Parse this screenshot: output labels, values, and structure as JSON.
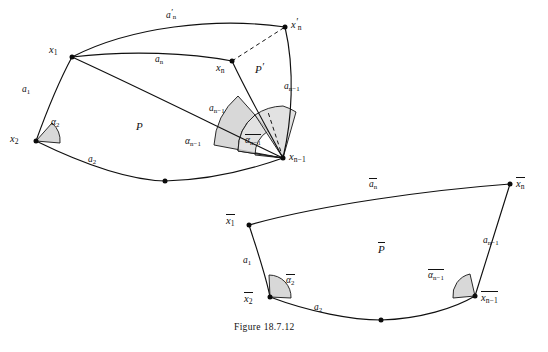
{
  "figure": {
    "caption": "Figure 18.7.12",
    "background_color": "#ffffff",
    "ink_color": "#111111",
    "angle_shade_color": "#cfcfcf"
  },
  "upper_diagram": {
    "name": "geodesic-polygon-P-and-P-prime",
    "region_labels": {
      "P": "P",
      "P_prime": "P′"
    },
    "vertices": [
      {
        "id": "x1",
        "label_html": "x<sub>1</sub>",
        "x": 72,
        "y": 57
      },
      {
        "id": "x2",
        "label_html": "x<sub>2</sub>",
        "x": 36,
        "y": 141
      },
      {
        "id": "xmid",
        "label_html": "",
        "x": 165,
        "y": 181
      },
      {
        "id": "xn_1",
        "label_html": "x<sub>n−1</sub>",
        "x": 283,
        "y": 158
      },
      {
        "id": "xn",
        "label_html": "x<sub>n</sub>",
        "x": 232,
        "y": 61
      },
      {
        "id": "xn_prime",
        "label_html": "x′<sub>n</sub>",
        "x": 285,
        "y": 27
      }
    ],
    "edge_labels": [
      {
        "id": "a1",
        "text": "a<sub>1</sub>",
        "x": 28,
        "y": 90
      },
      {
        "id": "a2",
        "text": "a<sub>2</sub>",
        "x": 94,
        "y": 161
      },
      {
        "id": "an",
        "text": "a<sub>n</sub>",
        "x": 161,
        "y": 61
      },
      {
        "id": "an_prime",
        "text": "a′<sub>n</sub>",
        "x": 173,
        "y": 14
      },
      {
        "id": "an_1_left",
        "text": "a<sub>n−1</sub>",
        "x": 218,
        "y": 110
      },
      {
        "id": "an_1_right",
        "text": "a<sub>n−1</sub>",
        "x": 290,
        "y": 88
      }
    ],
    "angle_labels": [
      {
        "id": "alpha2",
        "text": "α<sub>2</sub>",
        "x": 57,
        "y": 124,
        "overline": false
      },
      {
        "id": "alpha_n_1",
        "text": "α<sub>n−1</sub>",
        "x": 196,
        "y": 143,
        "overline": false
      },
      {
        "id": "alpha_n_1_bar",
        "text": "α<sub>n−1</sub>",
        "x": 253,
        "y": 140,
        "overline": true
      }
    ],
    "dashed_segment": {
      "from": "xn",
      "to": "xn_prime"
    }
  },
  "lower_diagram": {
    "name": "comparison-polygon-P-bar",
    "region_labels": {
      "P_bar": "P"
    },
    "vertices": [
      {
        "id": "x1b",
        "label_html": "x<sub>1</sub>",
        "x": 249,
        "y": 225,
        "overline": true
      },
      {
        "id": "x2b",
        "label_html": "x<sub>2</sub>",
        "x": 270,
        "y": 297,
        "overline": true
      },
      {
        "id": "xmidb",
        "label_html": "",
        "x": 381,
        "y": 320,
        "overline": false
      },
      {
        "id": "xn_1b",
        "label_html": "x<sub>n−1</sub>",
        "x": 475,
        "y": 296,
        "overline": true
      },
      {
        "id": "xnb",
        "label_html": "x<sub>n</sub>",
        "x": 510,
        "y": 184,
        "overline": true
      }
    ],
    "edge_labels": [
      {
        "id": "a1b",
        "text": "a<sub>1</sub>",
        "x": 249,
        "y": 262,
        "overline": false
      },
      {
        "id": "a2b",
        "text": "a<sub>2</sub>",
        "x": 320,
        "y": 309,
        "overline": false
      },
      {
        "id": "an_1b",
        "text": "a<sub>n−1</sub>",
        "x": 489,
        "y": 242,
        "overline": false
      },
      {
        "id": "anb",
        "text": "a<sub>n</sub>",
        "x": 375,
        "y": 185,
        "overline": true
      }
    ],
    "angle_labels": [
      {
        "id": "alpha2b",
        "text": "α<sub>2</sub>",
        "x": 292,
        "y": 281,
        "overline": true
      },
      {
        "id": "alpha_n_1b",
        "text": "α<sub>n−1</sub>",
        "x": 439,
        "y": 276,
        "overline": true
      }
    ]
  }
}
